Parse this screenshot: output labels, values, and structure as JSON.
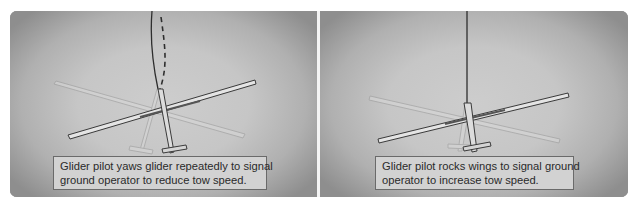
{
  "panels": [
    {
      "id": "yaw",
      "caption": {
        "line1": "Glider pilot yaws glider repeatedly to signal",
        "line2": "ground operator to reduce tow speed."
      },
      "illustration": "glider yawing on tow line (solid and dashed tow rope)"
    },
    {
      "id": "rock",
      "caption": {
        "line1": "Glider pilot rocks wings to signal ground",
        "line2": "operator to increase tow speed."
      },
      "illustration": "glider rocking wings on straight tow line"
    }
  ],
  "colors": {
    "panel_center": "#cdcdcd",
    "panel_edge": "#8e8e8e",
    "caption_bg": "#d2d2d2",
    "caption_border": "#6a6a6a",
    "divider": "#f4f4f4",
    "tow_line": "#333333"
  }
}
